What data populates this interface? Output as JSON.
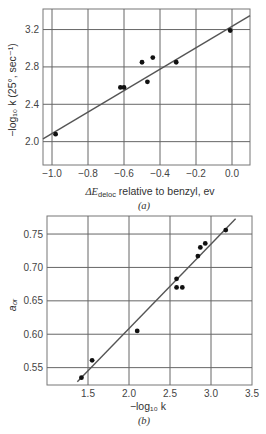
{
  "chart_data": [
    {
      "type": "scatter",
      "panel": "(a)",
      "caption": "(a)",
      "xlabel_main": "ΔE",
      "xlabel_sub": "deloc",
      "xlabel_rest": "relative to benzyl, ev",
      "ylabel": "−log₁₀ k (25°, sec⁻¹)",
      "xlim": [
        -1.05,
        0.1
      ],
      "ylim": [
        1.75,
        3.42
      ],
      "xticks": [
        -1.0,
        -0.8,
        -0.6,
        -0.4,
        -0.2,
        0.0
      ],
      "xtick_labels": [
        "−1.0",
        "−0.8",
        "−0.6",
        "−0.4",
        "−0.2",
        "0.0"
      ],
      "yticks": [
        2.0,
        2.4,
        2.8,
        3.2
      ],
      "ytick_labels": [
        "2.0",
        "2.4",
        "2.8",
        "3.2"
      ],
      "grid": true,
      "points": [
        {
          "x": -0.98,
          "y": 2.08
        },
        {
          "x": -0.62,
          "y": 2.58
        },
        {
          "x": -0.6,
          "y": 2.58
        },
        {
          "x": -0.5,
          "y": 2.85
        },
        {
          "x": -0.47,
          "y": 2.64
        },
        {
          "x": -0.44,
          "y": 2.9
        },
        {
          "x": -0.31,
          "y": 2.85
        },
        {
          "x": -0.01,
          "y": 3.19
        }
      ],
      "fit_line": {
        "x1": -1.05,
        "y1": 2.03,
        "x2": 0.1,
        "y2": 3.35
      }
    },
    {
      "type": "scatter",
      "panel": "(b)",
      "caption": "(b)",
      "xlabel": "−log₁₀ k",
      "ylabel": "a₀ᵣ",
      "xlim": [
        1.0,
        3.5
      ],
      "ylim": [
        0.524,
        0.777
      ],
      "xticks": [
        1.5,
        2.0,
        2.5,
        3.0,
        3.5
      ],
      "xtick_labels": [
        "1.5",
        "2.0",
        "2.5",
        "3.0",
        "3.5"
      ],
      "yticks": [
        0.55,
        0.6,
        0.65,
        0.7,
        0.75
      ],
      "ytick_labels": [
        "0.55",
        "0.60",
        "0.65",
        "0.70",
        "0.75"
      ],
      "grid": true,
      "points": [
        {
          "x": 1.42,
          "y": 0.535
        },
        {
          "x": 1.55,
          "y": 0.561
        },
        {
          "x": 2.1,
          "y": 0.605
        },
        {
          "x": 2.58,
          "y": 0.683
        },
        {
          "x": 2.58,
          "y": 0.67
        },
        {
          "x": 2.65,
          "y": 0.67
        },
        {
          "x": 2.84,
          "y": 0.717
        },
        {
          "x": 2.87,
          "y": 0.73
        },
        {
          "x": 2.93,
          "y": 0.736
        },
        {
          "x": 3.18,
          "y": 0.756
        }
      ],
      "fit_line": {
        "x1": 1.37,
        "y1": 0.529,
        "x2": 3.3,
        "y2": 0.773
      }
    }
  ]
}
